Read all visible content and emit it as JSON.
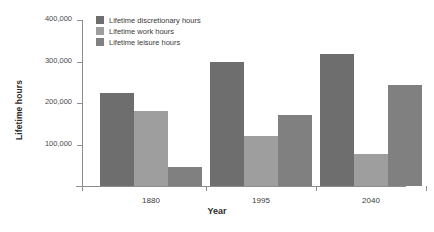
{
  "chart_data": {
    "type": "bar",
    "title": "",
    "xlabel": "Year",
    "ylabel": "Lifetime hours",
    "categories": [
      "1880",
      "1995",
      "2040"
    ],
    "series": [
      {
        "name": "Lifetime discretionary hours",
        "color": "#6e6e6e",
        "values": [
          225000,
          298000,
          317000
        ]
      },
      {
        "name": "Lifetime work hours",
        "color": "#9e9e9e",
        "values": [
          180000,
          120000,
          77000
        ]
      },
      {
        "name": "Lifetime leisure hours",
        "color": "#808080",
        "values": [
          45000,
          172000,
          243000
        ]
      }
    ],
    "ylim": [
      0,
      400000
    ],
    "ytick_values": [
      100000,
      200000,
      300000,
      400000
    ],
    "ytick_labels": [
      "100,000",
      "200,000",
      "300,000",
      "400,000"
    ],
    "grid": false,
    "legend_position": "top-left-inside"
  },
  "axes": {
    "y_title": "Lifetime hours",
    "x_title": "Year"
  },
  "legend": {
    "entries": [
      {
        "label": "Lifetime discretionary hours",
        "swatch": "#6e6e6e"
      },
      {
        "label": "Lifetime work hours",
        "swatch": "#9e9e9e"
      },
      {
        "label": "Lifetime leisure hours",
        "swatch": "#808080"
      }
    ]
  }
}
